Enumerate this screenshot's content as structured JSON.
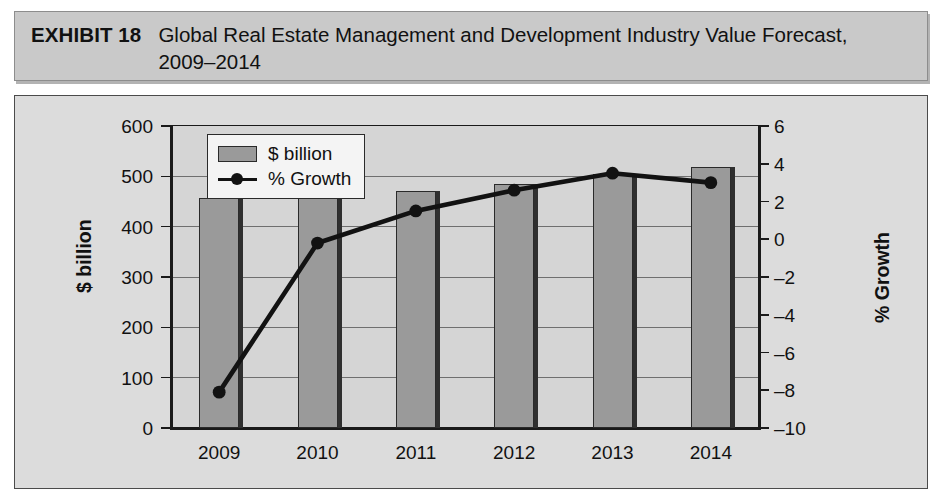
{
  "exhibit": {
    "label": "EXHIBIT 18",
    "title": "Global Real Estate Management and Development Industry Value Forecast, 2009–2014"
  },
  "chart_data": {
    "type": "bar",
    "title": "Global Real Estate Management and Development Industry Value Forecast, 2009–2014",
    "categories": [
      "2009",
      "2010",
      "2011",
      "2012",
      "2013",
      "2014"
    ],
    "series": [
      {
        "name": "$ billion",
        "type": "bar",
        "axis": "left",
        "values": [
          457,
          462,
          471,
          485,
          505,
          518
        ],
        "color": "#9a9a9a"
      },
      {
        "name": "% Growth",
        "type": "line",
        "axis": "right",
        "values": [
          -8.1,
          -0.2,
          1.5,
          2.6,
          3.5,
          3.0
        ],
        "color": "#121212"
      }
    ],
    "xlabel": "",
    "ylabel": "$ billion",
    "y2label": "% Growth",
    "ylim": [
      0,
      600
    ],
    "y2lim": [
      -10,
      6
    ],
    "yticks": [
      "0",
      "100",
      "200",
      "300",
      "400",
      "500",
      "600"
    ],
    "y2ticks": [
      "–10",
      "–8",
      "–6",
      "–4",
      "–2",
      "0",
      "2",
      "4",
      "6"
    ],
    "grid": true,
    "legend_position": "top-left",
    "legend": [
      "$ billion",
      "% Growth"
    ]
  }
}
